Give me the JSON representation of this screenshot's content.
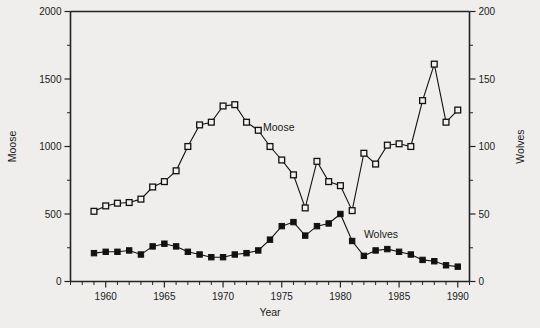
{
  "chart_data": {
    "type": "line",
    "title": "",
    "xlabel": "Year",
    "ylabel": "Moose",
    "y2label": "Wolves",
    "xlim": [
      1957,
      1991
    ],
    "ylim": [
      0,
      2000
    ],
    "y2lim": [
      0,
      200
    ],
    "grid": false,
    "legend": "inline-annotations",
    "x_ticks_major": [
      1960,
      1965,
      1970,
      1975,
      1980,
      1985,
      1990
    ],
    "x_tick_labels": [
      "1960",
      "1965",
      "1970",
      "1975",
      "1980",
      "1985",
      "1990"
    ],
    "x_ticks_minor_step": 1,
    "y_ticks_major": [
      0,
      500,
      1000,
      1500,
      2000
    ],
    "y_tick_labels": [
      "0",
      "500",
      "1000",
      "1500",
      "2000"
    ],
    "y_ticks_minor": [
      250,
      750,
      1250,
      1750
    ],
    "y2_ticks_major": [
      0,
      50,
      100,
      150,
      200
    ],
    "y2_tick_labels": [
      "0",
      "50",
      "100",
      "150",
      "200"
    ],
    "y2_ticks_minor": [
      25,
      75,
      125,
      175
    ],
    "x": [
      1959,
      1960,
      1961,
      1962,
      1963,
      1964,
      1965,
      1966,
      1967,
      1968,
      1969,
      1970,
      1971,
      1972,
      1973,
      1974,
      1975,
      1976,
      1977,
      1978,
      1979,
      1980,
      1981,
      1982,
      1983,
      1984,
      1985,
      1986,
      1987,
      1988,
      1989,
      1990
    ],
    "series": [
      {
        "name": "Moose",
        "axis": "left",
        "marker": "open-square",
        "label_x": 1973.4,
        "label_y": 1115,
        "values": [
          520,
          560,
          580,
          585,
          610,
          700,
          740,
          820,
          1000,
          1160,
          1180,
          1300,
          1310,
          1180,
          1120,
          1000,
          900,
          790,
          545,
          890,
          740,
          710,
          525,
          950,
          870,
          1010,
          1020,
          1000,
          1340,
          1610,
          1180,
          1270
        ]
      },
      {
        "name": "Wolves",
        "axis": "right",
        "marker": "filled-square",
        "label_x": 1982.0,
        "label_y": 32,
        "values": [
          21,
          22,
          22,
          23,
          20,
          26,
          28,
          26,
          22,
          20,
          18,
          18,
          20,
          21,
          23,
          31,
          41,
          44,
          34,
          41,
          43,
          50,
          30,
          19,
          23,
          24,
          22,
          20,
          16,
          15,
          12,
          11
        ]
      }
    ],
    "annotations": [
      {
        "text": "Moose",
        "x": 1973.4,
        "y": 1115
      },
      {
        "text": "Wolves",
        "x": 1982.0,
        "y": 32
      }
    ]
  }
}
